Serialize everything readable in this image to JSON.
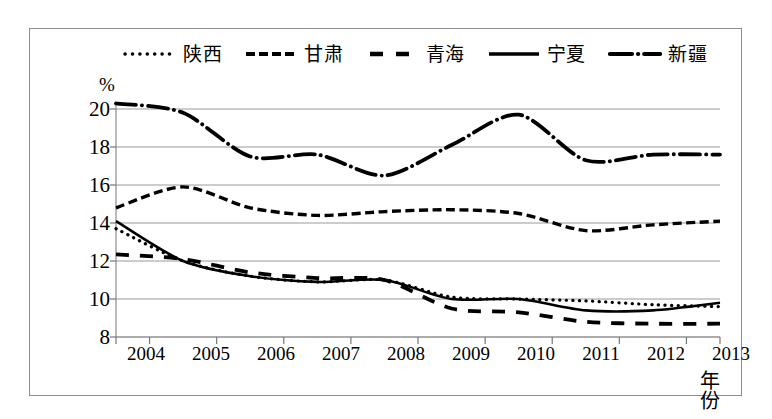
{
  "figure": {
    "background_color": "#ffffff",
    "frame_color": "#8c8c8c"
  },
  "legend": {
    "position": "top",
    "items": [
      {
        "label": "陕西",
        "style": "dotted",
        "swatch_name": "legend-swatch-shaanxi"
      },
      {
        "label": "甘肃",
        "style": "dashed",
        "swatch_name": "legend-swatch-gansu"
      },
      {
        "label": "青海",
        "style": "longdash",
        "swatch_name": "legend-swatch-qinghai"
      },
      {
        "label": "宁夏",
        "style": "solid",
        "swatch_name": "legend-swatch-ningxia"
      },
      {
        "label": "新疆",
        "style": "dashdot",
        "swatch_name": "legend-swatch-xinjiang"
      }
    ]
  },
  "axes": {
    "y_unit": "%",
    "x_title": "年份",
    "y_ticks": [
      "20",
      "18",
      "16",
      "14",
      "12",
      "10",
      "8"
    ],
    "x_ticks": [
      "2004",
      "2005",
      "2006",
      "2007",
      "2008",
      "2009",
      "2010",
      "2011",
      "2012",
      "2013"
    ]
  },
  "chart_data": {
    "type": "line",
    "title": "",
    "xlabel": "年份",
    "ylabel": "%",
    "xlim": [
      2004,
      2013
    ],
    "ylim": [
      8,
      20
    ],
    "ytick_values": [
      8,
      10,
      12,
      14,
      16,
      18,
      20
    ],
    "grid": true,
    "legend_position": "top",
    "categories": [
      2004,
      2005,
      2006,
      2007,
      2008,
      2009,
      2010,
      2011,
      2012,
      2013
    ],
    "series": [
      {
        "name": "陕西",
        "line_style": "dotted",
        "color": "#000000",
        "values": [
          13.7,
          12.0,
          11.2,
          10.9,
          11.0,
          10.1,
          10.0,
          9.9,
          9.7,
          9.6
        ]
      },
      {
        "name": "甘肃",
        "line_style": "dashed",
        "color": "#000000",
        "values": [
          14.8,
          15.9,
          14.8,
          14.4,
          14.6,
          14.7,
          14.5,
          13.6,
          13.9,
          14.1
        ]
      },
      {
        "name": "青海",
        "line_style": "longdash",
        "color": "#000000",
        "values": [
          12.35,
          12.1,
          11.4,
          11.1,
          11.0,
          9.5,
          9.3,
          8.8,
          8.7,
          8.7
        ]
      },
      {
        "name": "宁夏",
        "line_style": "solid",
        "color": "#000000",
        "values": [
          14.1,
          12.0,
          11.2,
          10.9,
          11.0,
          10.0,
          10.0,
          9.4,
          9.4,
          9.8
        ]
      },
      {
        "name": "新疆",
        "line_style": "dashdot",
        "color": "#000000",
        "values": [
          20.3,
          19.8,
          17.5,
          17.6,
          16.5,
          18.1,
          19.7,
          17.3,
          17.6,
          17.6
        ]
      }
    ]
  }
}
